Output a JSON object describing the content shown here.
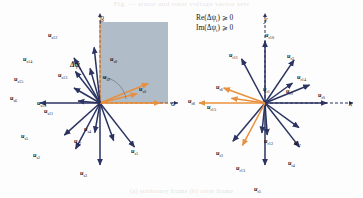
{
  "figure": {
    "top_caption_fragment": "Fig. — stator and rotor voltage vector sets",
    "bottom_caption_fragment": "(a) stationary frame   (b) rotor frame",
    "shade_color": "#a9b6c2",
    "vector_color": "#2b3360",
    "highlight_color": "#e8903d",
    "axis_color": "#2b3360"
  },
  "panel_left": {
    "name": "alpha-beta-frame",
    "axis_x_label": "α",
    "axis_y_label": "β",
    "angle_label": "Δψ",
    "angle_label_sub": "i",
    "condition_line1": "Re(Δψ",
    "condition_line1_sub": "i",
    "condition_line1_tail": ") ⩾ 0",
    "condition_line2": "Im(Δψ",
    "condition_line2_sub": "i",
    "condition_line2_tail": ") ⩾ 0",
    "vectors": [
      {
        "id": "us0",
        "label": "u",
        "sub": "s0",
        "angle": 0,
        "len": 60,
        "color": "#e8903d",
        "lx": 139,
        "ly": 86
      },
      {
        "id": "us1",
        "label": "u",
        "sub": "s1",
        "angle": -52,
        "len": 56,
        "color": "#2b3360",
        "lx": 131,
        "ly": 148
      },
      {
        "id": "us2",
        "label": "u",
        "sub": "s2",
        "angle": -118,
        "len": 52,
        "color": "#2b3360",
        "lx": 33,
        "ly": 152
      },
      {
        "id": "us3",
        "label": "u",
        "sub": "s3",
        "angle": -90,
        "len": 62,
        "color": "#2b3360",
        "lx": 80,
        "ly": 170
      },
      {
        "id": "us4",
        "label": "u",
        "sub": "s4",
        "angle": -70,
        "len": 40,
        "color": "#2b3360",
        "lx": 84,
        "ly": 126
      },
      {
        "id": "us5",
        "label": "u",
        "sub": "s5",
        "angle": -138,
        "len": 48,
        "color": "#2b3360",
        "lx": 21,
        "ly": 133
      },
      {
        "id": "us6",
        "label": "u",
        "sub": "s6",
        "angle": 180,
        "len": 60,
        "color": "#2b3360",
        "lx": 10,
        "ly": 95
      },
      {
        "id": "us7",
        "label": "u",
        "sub": "s7",
        "angle": -100,
        "len": 30,
        "color": "#2b3360",
        "lx": 74,
        "ly": 138
      },
      {
        "id": "us8",
        "label": "u",
        "sub": "s8",
        "angle": 22,
        "len": 52,
        "color": "#e8903d",
        "lx": 110,
        "ly": 56
      },
      {
        "id": "us9",
        "label": "u",
        "sub": "s9",
        "angle": 14,
        "len": 38,
        "color": "#e8903d",
        "lx": 103,
        "ly": 74
      },
      {
        "id": "us10",
        "label": "u",
        "sub": "s10",
        "angle": 150,
        "len": 30,
        "color": "#2b3360",
        "lx": 37,
        "ly": 100
      },
      {
        "id": "us11",
        "label": "u",
        "sub": "s11",
        "angle": 175,
        "len": 22,
        "color": "#2b3360",
        "lx": 44,
        "ly": 108
      },
      {
        "id": "us12",
        "label": "u",
        "sub": "s12",
        "angle": 96,
        "len": 56,
        "color": "#2b3360",
        "lx": 48,
        "ly": 32
      },
      {
        "id": "us13",
        "label": "u",
        "sub": "s13",
        "angle": 106,
        "len": 36,
        "color": "#2b3360",
        "lx": 58,
        "ly": 72
      },
      {
        "id": "us14",
        "label": "u",
        "sub": "s14",
        "angle": 120,
        "len": 52,
        "color": "#2b3360",
        "lx": 23,
        "ly": 56
      },
      {
        "id": "us15",
        "label": "u",
        "sub": "s15",
        "angle": 128,
        "len": 40,
        "color": "#2b3360",
        "lx": 14,
        "ly": 76
      }
    ]
  },
  "panel_right": {
    "name": "x-y-frame",
    "axis_x_label": "x",
    "axis_y_label": "y",
    "vectors": [
      {
        "id": "ur0",
        "label": "u",
        "sub": "r0",
        "angle": 0,
        "len": 62,
        "color": "#2b3360",
        "lx": 318,
        "ly": 92
      },
      {
        "id": "ur1",
        "label": "u",
        "sub": "r1",
        "angle": -96,
        "len": 30,
        "color": "#2b3360",
        "lx": 263,
        "ly": 86
      },
      {
        "id": "ur2",
        "label": "u",
        "sub": "r2",
        "angle": 56,
        "len": 52,
        "color": "#2b3360",
        "lx": 287,
        "ly": 53
      },
      {
        "id": "ur3",
        "label": "u",
        "sub": "r3",
        "angle": -130,
        "len": 50,
        "color": "#2b3360",
        "lx": 216,
        "ly": 150
      },
      {
        "id": "ur4",
        "label": "u",
        "sub": "r4",
        "angle": -52,
        "len": 56,
        "color": "#2b3360",
        "lx": 288,
        "ly": 160
      },
      {
        "id": "ur5",
        "label": "u",
        "sub": "r5",
        "angle": -90,
        "len": 62,
        "color": "#2b3360",
        "lx": 254,
        "ly": 186
      },
      {
        "id": "ur6",
        "label": "u",
        "sub": "r6",
        "angle": 160,
        "len": 44,
        "color": "#e8903d",
        "lx": 216,
        "ly": 84
      },
      {
        "id": "ur7",
        "label": "u",
        "sub": "r7",
        "angle": -36,
        "len": 42,
        "color": "#2b3360",
        "lx": 294,
        "ly": 140
      },
      {
        "id": "ur8",
        "label": "u",
        "sub": "r8",
        "angle": 180,
        "len": 66,
        "color": "#e8903d",
        "lx": 188,
        "ly": 98
      },
      {
        "id": "ur9",
        "label": "u",
        "sub": "r9",
        "angle": 36,
        "len": 34,
        "color": "#2b3360",
        "lx": 286,
        "ly": 88
      },
      {
        "id": "ur10",
        "label": "u",
        "sub": "r10",
        "angle": 90,
        "len": 62,
        "color": "#2b3360",
        "lx": 265,
        "ly": 32
      },
      {
        "id": "ur11",
        "label": "u",
        "sub": "r11",
        "angle": 118,
        "len": 50,
        "color": "#2b3360",
        "lx": 229,
        "ly": 52
      },
      {
        "id": "ur12",
        "label": "u",
        "sub": "r12",
        "angle": -86,
        "len": 32,
        "color": "#2b3360",
        "lx": 264,
        "ly": 138
      },
      {
        "id": "ur13",
        "label": "u",
        "sub": "r13",
        "angle": -118,
        "len": 48,
        "color": "#e8903d",
        "lx": 236,
        "ly": 165
      },
      {
        "id": "ur14",
        "label": "u",
        "sub": "r14",
        "angle": 22,
        "len": 48,
        "color": "#2b3360",
        "lx": 297,
        "ly": 74
      },
      {
        "id": "ur15",
        "label": "u",
        "sub": "r15",
        "angle": 172,
        "len": 34,
        "color": "#e8903d",
        "lx": 207,
        "ly": 104
      }
    ]
  }
}
